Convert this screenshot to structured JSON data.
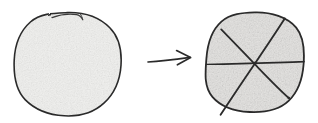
{
  "figure": {
    "title": "Whole circle transformed into a circle divided into six equal parts",
    "caption": "",
    "background_color": "#ffffff",
    "width": 318,
    "height": 123,
    "medium": "hand-drawn pencil sketch"
  },
  "palette": {
    "ink": "#2b2b2b",
    "ink_light": "#4a4a4a",
    "shade_left": "#f1f1ef",
    "shade_right": "#e6e5e3",
    "background": "#ffffff"
  },
  "shapes": {
    "left_circle": {
      "label": "whole circle",
      "center_x": 67,
      "center_y": 64,
      "radius": 52,
      "parts": 1,
      "fill_color": "#f1f1ef",
      "stroke_color": "#2b2b2b",
      "stroke_width": 1.6,
      "has_top_overlap_stroke": true
    },
    "arrow": {
      "label": "transforms into",
      "glyph": "arrow-right",
      "x_start": 148,
      "x_end": 191,
      "y": 60,
      "stroke_color": "#2b2b2b",
      "stroke_width": 1.7
    },
    "right_circle": {
      "label": "circle divided into six parts",
      "center_x": 255,
      "center_y": 63,
      "radius": 49,
      "parts": 6,
      "fill_color": "#e6e5e3",
      "stroke_color": "#2b2b2b",
      "stroke_width": 1.8,
      "divider_count": 3,
      "dividers": [
        {
          "name": "horizontal-divider",
          "angle_degrees": 0,
          "overshoot": false
        },
        {
          "name": "diagonal-divider-rising",
          "angle_degrees": 60,
          "overshoot": true
        },
        {
          "name": "diagonal-divider-falling",
          "angle_degrees": 120,
          "overshoot": true
        }
      ]
    }
  }
}
